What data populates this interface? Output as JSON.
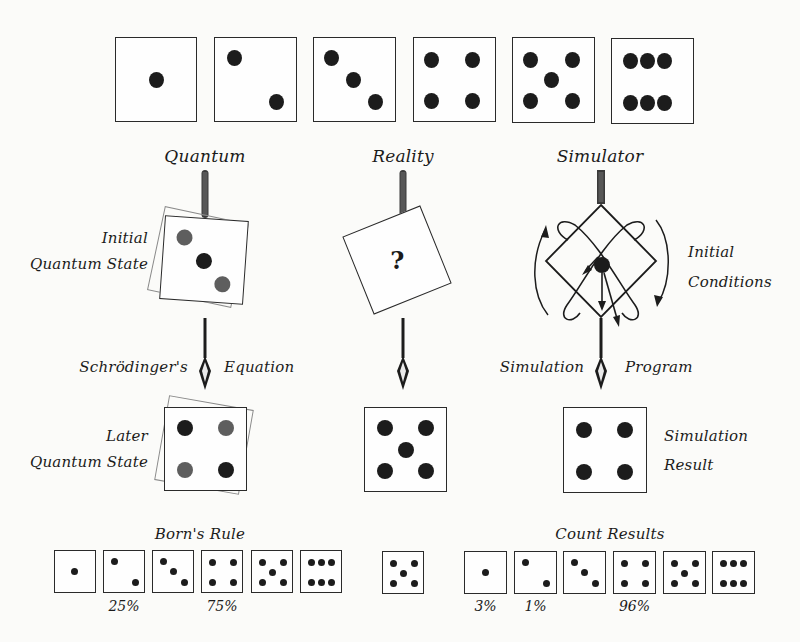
{
  "top_row": {
    "dice": [
      {
        "face": 1,
        "pips": [
          [
            0.5,
            0.5
          ]
        ]
      },
      {
        "face": 2,
        "pips": [
          [
            0.3,
            0.25
          ],
          [
            0.7,
            0.75
          ]
        ]
      },
      {
        "face": 3,
        "pips": [
          [
            0.3,
            0.25
          ],
          [
            0.5,
            0.5
          ],
          [
            0.7,
            0.75
          ]
        ]
      },
      {
        "face": 4,
        "pips": [
          [
            0.27,
            0.26
          ],
          [
            0.73,
            0.26
          ],
          [
            0.27,
            0.74
          ],
          [
            0.73,
            0.74
          ]
        ]
      },
      {
        "face": 5,
        "pips": [
          [
            0.26,
            0.25
          ],
          [
            0.74,
            0.25
          ],
          [
            0.5,
            0.5
          ],
          [
            0.26,
            0.75
          ],
          [
            0.74,
            0.75
          ]
        ]
      },
      {
        "face": 6,
        "pips": [
          [
            0.28,
            0.26
          ],
          [
            0.5,
            0.26
          ],
          [
            0.72,
            0.26
          ],
          [
            0.28,
            0.74
          ],
          [
            0.5,
            0.74
          ],
          [
            0.72,
            0.74
          ]
        ]
      }
    ]
  },
  "columns": {
    "quantum": {
      "title": "Quantum",
      "initial_label_line1": "Initial",
      "initial_label_line2": "Quantum State",
      "process_left": "Schrödinger's",
      "process_right": "Equation",
      "later_label_line1": "Later",
      "later_label_line2": "Quantum State",
      "later_face": 4
    },
    "reality": {
      "title": "Reality",
      "unknown_symbol": "?",
      "result_face": 5
    },
    "simulator": {
      "title": "Simulator",
      "initial_label_line1": "Initial",
      "initial_label_line2": "Conditions",
      "process_left": "Simulation",
      "process_right": "Program",
      "result_label_line1": "Simulation",
      "result_label_line2": "Result",
      "result_face": 4
    }
  },
  "bottom": {
    "born_rule": {
      "title": "Born's Rule",
      "faces": [
        1,
        2,
        3,
        4,
        5,
        6
      ],
      "percentages": [
        {
          "face": 2,
          "label": "25%"
        },
        {
          "face": 4,
          "label": "75%"
        }
      ]
    },
    "reality_result": {
      "face": 5
    },
    "count_results": {
      "title": "Count Results",
      "faces": [
        1,
        2,
        3,
        4,
        5,
        6
      ],
      "percentages": [
        {
          "face": 1,
          "label": "3%"
        },
        {
          "face": 2,
          "label": "1%"
        },
        {
          "face": 4,
          "label": "96%"
        }
      ]
    }
  },
  "colors": {
    "background": "#fbfbf9",
    "ink": "#1c1c1c",
    "faded_pip": "#5a5a5a",
    "ghost_outline": "#8a8a8a"
  }
}
